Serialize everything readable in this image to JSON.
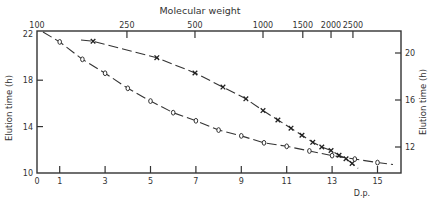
{
  "chart_data": {
    "type": "line",
    "title": "",
    "xlabel": "D.p.",
    "ylabel": "Elution time (h)",
    "x2label": "Molecular weight",
    "y2label": "Elution time (h)",
    "xlim": [
      0,
      16
    ],
    "ylim": [
      10,
      22
    ],
    "y2lim": [
      10.4,
      22.1
    ],
    "x_ticks": [
      0,
      1,
      3,
      5,
      7,
      9,
      11,
      13,
      15
    ],
    "y_ticks": [
      10,
      14,
      18,
      22
    ],
    "x2_ticks": [
      100,
      250,
      500,
      1000,
      1500,
      2000,
      2500
    ],
    "x2_scale": "log",
    "y2_ticks": [
      12,
      16,
      20
    ],
    "grid": false,
    "legend": "none",
    "series": [
      {
        "name": "Elution time vs D.p.",
        "marker": "o",
        "axes": "bottom-left",
        "x": [
          1,
          2,
          3,
          4,
          5,
          6,
          7,
          8,
          9,
          10,
          11,
          12,
          13,
          14,
          15
        ],
        "y": [
          21.3,
          19.8,
          18.6,
          17.3,
          16.2,
          15.2,
          14.5,
          13.7,
          13.2,
          12.6,
          12.3,
          11.9,
          11.5,
          11.2,
          10.9
        ]
      },
      {
        "name": "Elution time vs Molecular weight",
        "marker": "x",
        "axes": "top-right",
        "x": [
          177,
          339,
          500,
          665,
          840,
          1000,
          1164,
          1330,
          1487,
          1660,
          1820,
          2000,
          2170,
          2330,
          2480
        ],
        "y": [
          21.0,
          19.6,
          18.3,
          17.1,
          16.1,
          15.1,
          14.3,
          13.6,
          13.0,
          12.4,
          12.0,
          11.7,
          11.3,
          11.0,
          10.6
        ]
      }
    ]
  },
  "labels": {
    "top_axis_title": "Molecular weight",
    "left_axis_title": "Elution time (h)",
    "right_axis_title": "Elution time (h)",
    "bottom_axis_title": "D.p."
  }
}
